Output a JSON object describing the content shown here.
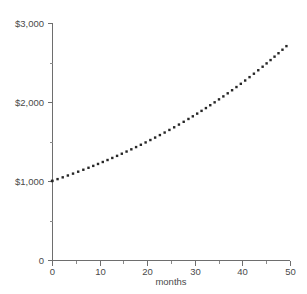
{
  "chart_data": {
    "type": "line",
    "title": "",
    "subtitle": "",
    "xlabel": "months",
    "ylabel": "",
    "xlim": [
      0,
      50
    ],
    "ylim": [
      0,
      3000
    ],
    "grid": false,
    "legend": false,
    "line_style": "dotted",
    "series": [
      {
        "name": "balance",
        "x": [
          0,
          2,
          4,
          6,
          8,
          10,
          12,
          14,
          16,
          18,
          20,
          22,
          24,
          26,
          28,
          30,
          32,
          34,
          36,
          38,
          40,
          42,
          44,
          46,
          48,
          50
        ],
        "values": [
          1000,
          1041,
          1084,
          1129,
          1175,
          1224,
          1274,
          1327,
          1382,
          1439,
          1498,
          1560,
          1624,
          1691,
          1761,
          1834,
          1910,
          1989,
          2071,
          2156,
          2245,
          2338,
          2434,
          2535,
          2639,
          2748
        ]
      }
    ],
    "x_ticks": [
      {
        "value": 0,
        "label": "0"
      },
      {
        "value": 10,
        "label": "10"
      },
      {
        "value": 20,
        "label": "20"
      },
      {
        "value": 30,
        "label": "30"
      },
      {
        "value": 40,
        "label": "40"
      },
      {
        "value": 50,
        "label": "50"
      }
    ],
    "x_minor_ticks": [
      5,
      15,
      25,
      35,
      45
    ],
    "y_ticks": [
      {
        "value": 0,
        "label": "0"
      },
      {
        "value": 1000,
        "label": "$1,000"
      },
      {
        "value": 2000,
        "label": "$2,000"
      },
      {
        "value": 3000,
        "label": "$3,000"
      }
    ],
    "y_minor_ticks": [
      500,
      1500,
      2500
    ],
    "colors": {
      "series": "#262626",
      "axis": "#6e6e6e",
      "text": "#4a4a4a",
      "background": "#ffffff"
    }
  }
}
